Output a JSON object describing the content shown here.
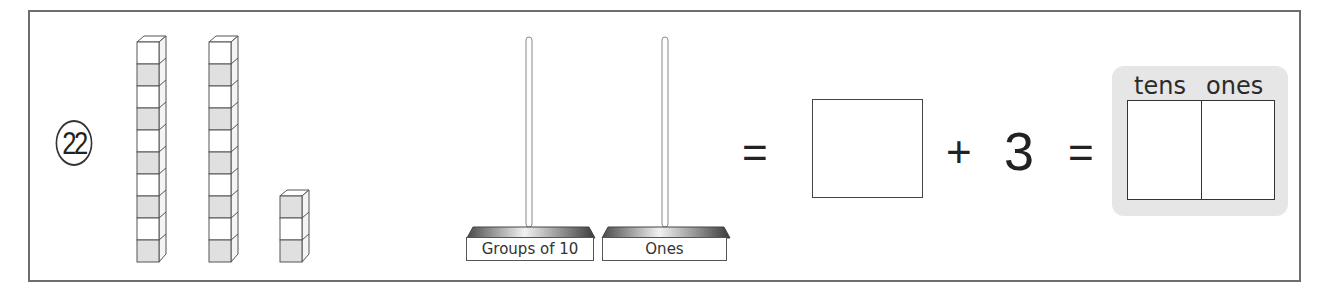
{
  "problem": {
    "number": "22"
  },
  "blocks": {
    "rods": [
      {
        "id": "rod-1",
        "cubes": 10
      },
      {
        "id": "rod-2",
        "cubes": 10
      }
    ],
    "units": {
      "cubes": 3
    }
  },
  "stands": [
    {
      "label": "Groups of 10"
    },
    {
      "label": "Ones"
    }
  ],
  "equation": {
    "equals_1": "=",
    "plus": "+",
    "addend": "3",
    "equals_2": "="
  },
  "place_value_chart": {
    "headers": [
      "tens",
      "ones"
    ]
  },
  "colors": {
    "border": "#6d6d6d",
    "cube_shade": "#e0e0e0",
    "panel_bg": "#e6e6e6"
  }
}
